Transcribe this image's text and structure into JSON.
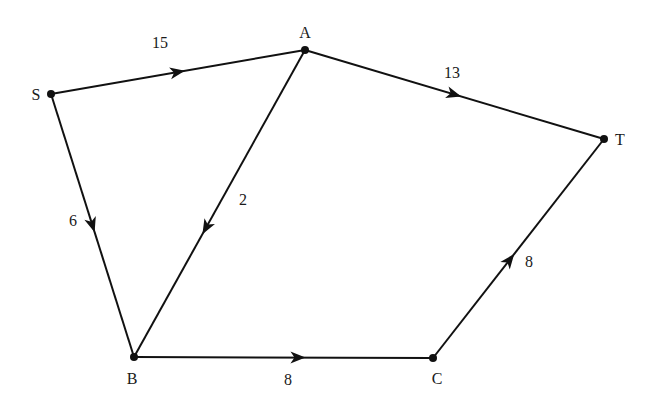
{
  "diagram": {
    "type": "directed-weighted-graph",
    "nodes": [
      {
        "id": "S",
        "label": "S",
        "x": 51,
        "y": 94,
        "lx": 36,
        "ly": 100
      },
      {
        "id": "A",
        "label": "A",
        "x": 305,
        "y": 50,
        "lx": 305,
        "ly": 38
      },
      {
        "id": "T",
        "label": "T",
        "x": 604,
        "y": 139,
        "lx": 620,
        "ly": 145
      },
      {
        "id": "B",
        "label": "B",
        "x": 134,
        "y": 357,
        "lx": 132,
        "ly": 384
      },
      {
        "id": "C",
        "label": "C",
        "x": 433,
        "y": 358,
        "lx": 437,
        "ly": 384
      }
    ],
    "edges": [
      {
        "from": "S",
        "to": "A",
        "weight": "15",
        "arrow_t": 0.5,
        "wx": 160,
        "wy": 48
      },
      {
        "from": "A",
        "to": "T",
        "weight": "13",
        "arrow_t": 0.5,
        "wx": 452,
        "wy": 78
      },
      {
        "from": "A",
        "to": "B",
        "weight": "2",
        "arrow_t": 0.58,
        "wx": 243,
        "wy": 205
      },
      {
        "from": "S",
        "to": "B",
        "weight": "6",
        "arrow_t": 0.5,
        "wx": 73,
        "wy": 226
      },
      {
        "from": "B",
        "to": "C",
        "weight": "8",
        "arrow_t": 0.55,
        "wx": 288,
        "wy": 385
      },
      {
        "from": "C",
        "to": "T",
        "weight": "8",
        "arrow_t": 0.45,
        "wx": 529,
        "wy": 267
      }
    ],
    "colors": {
      "stroke": "#111111",
      "text": "#1a1a1a",
      "background": "#ffffff"
    }
  }
}
